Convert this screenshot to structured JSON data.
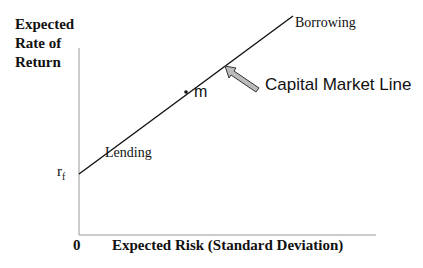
{
  "diagram": {
    "title": "Capital Market Line",
    "y_axis_label": "Expected Rate of Return",
    "y_axis_label_lines": [
      "Expected",
      "Rate of",
      "Return"
    ],
    "x_axis_label": "Expected Risk (Standard Deviation)",
    "origin_label": "0",
    "intercept_label": "r",
    "intercept_subscript": "f",
    "lower_segment_label": "Lending",
    "upper_segment_label": "Borrowing",
    "market_portfolio_label": "m",
    "line_annotation": "Capital Market Line",
    "colors": {
      "line": "#111111",
      "axis": "#999999",
      "arrow_fill": "#bbbbbb",
      "arrow_stroke": "#333333"
    }
  }
}
